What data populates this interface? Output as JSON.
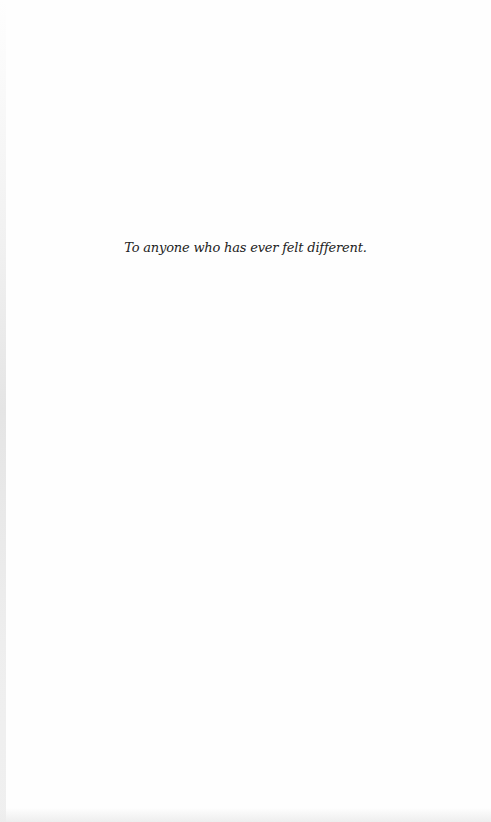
{
  "page": {
    "type": "dedication-page",
    "background_color": "#fefefe",
    "text_color": "#222222"
  },
  "dedication": {
    "text": "To anyone who has ever felt different."
  }
}
